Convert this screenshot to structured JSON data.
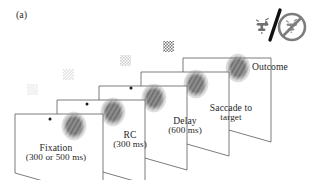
{
  "figure": {
    "panel_letter": "(a)",
    "type": "experimental-task-sequence-diagram",
    "colors": {
      "screen_outline": "#5a5a5a",
      "target_fill": "#8c8c8c",
      "cue_patch": "#b9b9b9",
      "fixation_dot": "#1a1a1a",
      "text": "#1f1f1f",
      "slash": "#111111",
      "prohibition": "#7d7d7d"
    }
  },
  "frames": [
    {
      "id": "fixation",
      "label_main": "Fixation",
      "label_sub": "(300 or 500 ms)",
      "has_fixation_dot": true,
      "has_cue_patch": true,
      "cue_contrast": "very-low",
      "has_target": true,
      "target_grating": "faint"
    },
    {
      "id": "rc",
      "label_main": "RC",
      "label_sub": "(300 ms)",
      "has_fixation_dot": true,
      "has_cue_patch": true,
      "cue_contrast": "low",
      "has_target": true,
      "target_grating": "visible"
    },
    {
      "id": "delay",
      "label_main": "Delay",
      "label_sub": "(600 ms)",
      "has_fixation_dot": true,
      "has_cue_patch": true,
      "cue_contrast": "medium",
      "has_target": true,
      "target_grating": "visible"
    },
    {
      "id": "saccade",
      "label_main": "Saccade to",
      "label_sub": "target",
      "has_fixation_dot": false,
      "has_cue_patch": true,
      "cue_contrast": "high",
      "has_target": true,
      "target_grating": "visible"
    },
    {
      "id": "outcome",
      "label_main": "Outcome",
      "label_sub": "",
      "has_fixation_dot": false,
      "has_cue_patch": false,
      "cue_contrast": "none",
      "has_target": true,
      "target_grating": "visible"
    }
  ],
  "outcome_icon": {
    "name": "reward-or-no-reward-icon",
    "reward_symbol": "water-faucet-icon",
    "separator": "/",
    "no_reward_symbol": "no-water-faucet-prohibited-icon"
  }
}
